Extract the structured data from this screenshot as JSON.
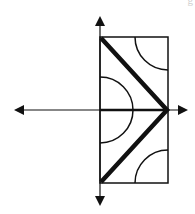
{
  "diagram": {
    "colors": {
      "stroke": "#111111",
      "background": "#ffffff"
    },
    "canvas": {
      "width": 195,
      "height": 214
    },
    "axes": {
      "origin": {
        "x": 100,
        "y": 110
      },
      "horizontal": {
        "x1": 22,
        "x2": 180,
        "y": 110,
        "arrow_left": true,
        "arrow_right": true
      },
      "vertical": {
        "x": 100,
        "y1": 24,
        "y2": 198,
        "arrow_top": true,
        "arrow_bottom": true
      }
    },
    "rectangle": {
      "x": 100,
      "y": 37,
      "width": 68,
      "height": 146
    },
    "thick_path": {
      "points": [
        [
          101,
          38
        ],
        [
          167,
          110
        ],
        [
          101,
          182
        ]
      ],
      "stroke_width": 4.5
    },
    "thick_axis_segment": {
      "x1": 100,
      "y1": 110,
      "x2": 167,
      "y2": 110,
      "stroke_width": 2.5
    },
    "arcs": [
      {
        "name": "origin-semicircle",
        "cx": 100,
        "cy": 110,
        "r": 33,
        "from_deg": -90,
        "to_deg": 90
      },
      {
        "name": "top-right-quarter",
        "cx": 168,
        "cy": 37,
        "r": 33,
        "from_deg": 90,
        "to_deg": 180
      },
      {
        "name": "bottom-right-quarter",
        "cx": 168,
        "cy": 183,
        "r": 33,
        "from_deg": 180,
        "to_deg": 270
      }
    ],
    "corner_fragment": "g"
  }
}
